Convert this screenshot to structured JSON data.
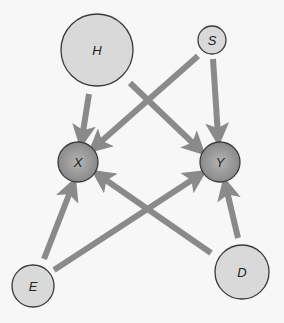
{
  "diagram": {
    "type": "causal-dag",
    "colors": {
      "background": "#f7f7f7",
      "light_node_fill": "#d9d9d9",
      "dark_node_fill": "#9a9a9a",
      "node_stroke": "#3a3a3a",
      "edge": "#8a8a8a"
    },
    "nodes": [
      {
        "id": "H",
        "label": "H",
        "cx": 97,
        "cy": 50,
        "r": 36,
        "style": "light"
      },
      {
        "id": "S",
        "label": "S",
        "cx": 212,
        "cy": 40,
        "r": 14,
        "style": "light"
      },
      {
        "id": "X",
        "label": "X",
        "cx": 78,
        "cy": 162,
        "r": 20,
        "style": "dark"
      },
      {
        "id": "Y",
        "label": "Y",
        "cx": 220,
        "cy": 162,
        "r": 20,
        "style": "dark"
      },
      {
        "id": "E",
        "label": "E",
        "cx": 33,
        "cy": 286,
        "r": 21,
        "style": "light"
      },
      {
        "id": "D",
        "label": "D",
        "cx": 242,
        "cy": 272,
        "r": 27,
        "style": "light"
      }
    ],
    "edges": [
      {
        "from": "H",
        "to": "X",
        "x1": 89,
        "y1": 94,
        "x2": 82,
        "y2": 138
      },
      {
        "from": "H",
        "to": "Y",
        "x1": 130,
        "y1": 83,
        "x2": 198,
        "y2": 148
      },
      {
        "from": "S",
        "to": "X",
        "x1": 198,
        "y1": 56,
        "x2": 96,
        "y2": 146
      },
      {
        "from": "S",
        "to": "Y",
        "x1": 213,
        "y1": 59,
        "x2": 218,
        "y2": 136
      },
      {
        "from": "E",
        "to": "X",
        "x1": 44,
        "y1": 259,
        "x2": 72,
        "y2": 187
      },
      {
        "from": "E",
        "to": "Y",
        "x1": 54,
        "y1": 270,
        "x2": 198,
        "y2": 176
      },
      {
        "from": "D",
        "to": "X",
        "x1": 211,
        "y1": 253,
        "x2": 100,
        "y2": 176
      },
      {
        "from": "D",
        "to": "Y",
        "x1": 238,
        "y1": 238,
        "x2": 226,
        "y2": 187
      }
    ]
  }
}
